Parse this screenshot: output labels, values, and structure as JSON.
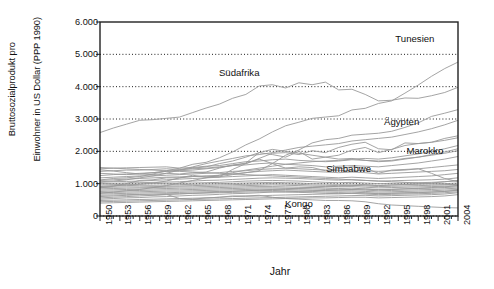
{
  "chart_data": {
    "type": "line",
    "title": "",
    "xlabel": "Jahr",
    "ylabel_line1": "Bruttosozialprodukt pro",
    "ylabel_line2": "Einwohner in US Dollar (PPP 1990)",
    "xlim": [
      1950,
      2004
    ],
    "ylim": [
      0,
      6000
    ],
    "grid": "horizontal-dotted",
    "legend": "inline-annotations",
    "yticks": [
      "0",
      "1.000",
      "2.000",
      "3.000",
      "4.000",
      "5.000",
      "6.000"
    ],
    "ytick_values": [
      0,
      1000,
      2000,
      3000,
      4000,
      5000,
      6000
    ],
    "xticks": [
      "1950",
      "1953",
      "1956",
      "1959",
      "1962",
      "1965",
      "1968",
      "1971",
      "1974",
      "1977",
      "1980",
      "1983",
      "1986",
      "1989",
      "1992",
      "1995",
      "1998",
      "2001",
      "2004"
    ],
    "xtick_values": [
      1950,
      1953,
      1956,
      1959,
      1962,
      1965,
      1968,
      1971,
      1974,
      1977,
      1980,
      1983,
      1986,
      1989,
      1992,
      1995,
      1998,
      2001,
      2004
    ],
    "line_color": "#9a9a9a",
    "annotations": [
      {
        "label": "Tunesien",
        "x": 1997.5,
        "y": 5500
      },
      {
        "label": "Südafrika",
        "x": 1971.0,
        "y": 4460
      },
      {
        "label": "Ägypten",
        "x": 1995.5,
        "y": 2930
      },
      {
        "label": "Marokko",
        "x": 1999.0,
        "y": 2030
      },
      {
        "label": "Simbabwe",
        "x": 1987.5,
        "y": 1480
      },
      {
        "label": "Kongo",
        "x": 1980.0,
        "y": 410
      }
    ],
    "x": [
      1950,
      1952,
      1954,
      1956,
      1958,
      1960,
      1962,
      1964,
      1966,
      1968,
      1970,
      1972,
      1974,
      1976,
      1978,
      1980,
      1982,
      1984,
      1986,
      1988,
      1990,
      1992,
      1994,
      1996,
      1998,
      2000,
      2002,
      2004
    ],
    "series": [
      {
        "name": "Tunesien",
        "values": [
          1115,
          1160,
          1180,
          1220,
          1300,
          1400,
          1480,
          1600,
          1660,
          1800,
          1980,
          2200,
          2380,
          2600,
          2790,
          2900,
          3020,
          3060,
          3100,
          3280,
          3330,
          3480,
          3560,
          3800,
          4050,
          4320,
          4560,
          4760
        ]
      },
      {
        "name": "Südafrika",
        "values": [
          2580,
          2720,
          2840,
          2960,
          2980,
          3020,
          3060,
          3200,
          3340,
          3460,
          3640,
          3760,
          4020,
          4060,
          3960,
          4120,
          4060,
          4140,
          3900,
          3920,
          3760,
          3560,
          3580,
          3650,
          3640,
          3720,
          3820,
          3980
        ]
      },
      {
        "name": "Ägypten",
        "values": [
          910,
          930,
          960,
          980,
          1020,
          1080,
          1180,
          1220,
          1230,
          1210,
          1280,
          1340,
          1400,
          1620,
          1880,
          2040,
          2260,
          2360,
          2400,
          2500,
          2530,
          2560,
          2620,
          2740,
          2880,
          3080,
          3180,
          3290
        ]
      },
      {
        "name": "Marokko",
        "values": [
          1430,
          1390,
          1340,
          1300,
          1280,
          1320,
          1300,
          1340,
          1360,
          1480,
          1580,
          1620,
          1780,
          1940,
          1960,
          1900,
          2020,
          1960,
          2120,
          2220,
          2280,
          2080,
          2050,
          2260,
          2240,
          2280,
          2400,
          2480
        ]
      },
      {
        "name": "Simbabwe",
        "values": [
          870,
          920,
          1000,
          1100,
          1120,
          1180,
          1180,
          1260,
          1200,
          1210,
          1440,
          1620,
          1760,
          1620,
          1480,
          1520,
          1500,
          1400,
          1460,
          1520,
          1480,
          1320,
          1420,
          1440,
          1460,
          1320,
          1160,
          1060
        ]
      },
      {
        "name": "Kongo",
        "values": [
          600,
          620,
          640,
          660,
          650,
          670,
          540,
          520,
          560,
          580,
          620,
          620,
          640,
          580,
          540,
          520,
          500,
          480,
          480,
          470,
          440,
          380,
          340,
          320,
          300,
          280,
          260,
          250
        ]
      },
      {
        "name": "other-01",
        "values": [
          1460,
          1480,
          1490,
          1500,
          1510,
          1520,
          1480,
          1500,
          1540,
          1560,
          1620,
          1680,
          1700,
          1740,
          1760,
          1720,
          1700,
          1680,
          1700,
          1740,
          1720,
          1700,
          1720,
          1780,
          1820,
          1880,
          1940,
          2020
        ]
      },
      {
        "name": "other-02",
        "values": [
          1380,
          1400,
          1420,
          1420,
          1440,
          1460,
          1440,
          1460,
          1480,
          1520,
          1560,
          1580,
          1620,
          1640,
          1600,
          1580,
          1560,
          1520,
          1540,
          1560,
          1540,
          1520,
          1560,
          1600,
          1640,
          1700,
          1760,
          1840
        ]
      },
      {
        "name": "other-03",
        "values": [
          1250,
          1280,
          1300,
          1320,
          1340,
          1380,
          1400,
          1420,
          1460,
          1500,
          1560,
          1640,
          1960,
          1900,
          1820,
          2000,
          1760,
          1820,
          1880,
          2040,
          2120,
          1960,
          2060,
          2180,
          2240,
          2280,
          2340,
          2420
        ]
      },
      {
        "name": "other-04",
        "values": [
          1180,
          1200,
          1220,
          1240,
          1240,
          1260,
          1280,
          1300,
          1320,
          1340,
          1380,
          1400,
          1440,
          1460,
          1480,
          1460,
          1440,
          1420,
          1400,
          1420,
          1400,
          1380,
          1400,
          1420,
          1460,
          1500,
          1540,
          1580
        ]
      },
      {
        "name": "other-05",
        "values": [
          1100,
          1120,
          1140,
          1160,
          1180,
          1200,
          1210,
          1220,
          1240,
          1260,
          1300,
          1340,
          1380,
          1400,
          1420,
          1400,
          1380,
          1360,
          1340,
          1360,
          1340,
          1300,
          1320,
          1340,
          1360,
          1380,
          1400,
          1440
        ]
      },
      {
        "name": "other-06",
        "values": [
          1040,
          1060,
          1070,
          1080,
          1100,
          1120,
          1140,
          1160,
          1180,
          1200,
          1220,
          1240,
          1260,
          1280,
          1260,
          1240,
          1220,
          1200,
          1180,
          1200,
          1180,
          1160,
          1180,
          1200,
          1220,
          1240,
          1280,
          1320
        ]
      },
      {
        "name": "other-07",
        "values": [
          1000,
          1010,
          1020,
          1030,
          1040,
          1050,
          1060,
          1080,
          1100,
          1110,
          1130,
          1150,
          1170,
          1180,
          1170,
          1160,
          1140,
          1120,
          1110,
          1120,
          1100,
          1080,
          1090,
          1100,
          1110,
          1120,
          1140,
          1180
        ]
      },
      {
        "name": "other-08",
        "values": [
          960,
          970,
          980,
          990,
          1000,
          1010,
          1010,
          1020,
          1030,
          1040,
          1060,
          1080,
          1090,
          1100,
          1090,
          1080,
          1060,
          1040,
          1030,
          1040,
          1020,
          1000,
          1010,
          1020,
          1030,
          1040,
          1060,
          1090
        ]
      },
      {
        "name": "other-09",
        "values": [
          920,
          930,
          940,
          950,
          950,
          960,
          970,
          980,
          990,
          1000,
          1010,
          1020,
          1030,
          1040,
          1030,
          1020,
          1000,
          990,
          980,
          990,
          970,
          950,
          960,
          970,
          980,
          990,
          1000,
          1020
        ]
      },
      {
        "name": "other-10",
        "values": [
          880,
          890,
          900,
          900,
          910,
          920,
          930,
          940,
          950,
          960,
          970,
          980,
          990,
          1000,
          990,
          980,
          960,
          950,
          940,
          950,
          930,
          910,
          920,
          930,
          940,
          950,
          960,
          980
        ]
      },
      {
        "name": "other-11",
        "values": [
          840,
          850,
          860,
          870,
          880,
          890,
          900,
          900,
          910,
          920,
          930,
          940,
          950,
          960,
          950,
          940,
          920,
          910,
          900,
          910,
          890,
          870,
          880,
          890,
          900,
          910,
          920,
          940
        ]
      },
      {
        "name": "other-12",
        "values": [
          800,
          810,
          820,
          830,
          840,
          850,
          860,
          860,
          870,
          880,
          890,
          900,
          910,
          910,
          900,
          890,
          880,
          860,
          850,
          860,
          840,
          820,
          830,
          840,
          850,
          860,
          880,
          900
        ]
      },
      {
        "name": "other-13",
        "values": [
          760,
          770,
          780,
          790,
          800,
          810,
          810,
          820,
          830,
          840,
          850,
          860,
          870,
          870,
          860,
          850,
          840,
          820,
          810,
          820,
          800,
          780,
          790,
          800,
          810,
          820,
          840,
          860
        ]
      },
      {
        "name": "other-14",
        "values": [
          720,
          730,
          740,
          750,
          760,
          770,
          770,
          780,
          790,
          800,
          810,
          820,
          830,
          830,
          820,
          810,
          800,
          780,
          770,
          780,
          760,
          740,
          750,
          760,
          770,
          780,
          800,
          820
        ]
      },
      {
        "name": "other-15",
        "values": [
          680,
          690,
          700,
          710,
          720,
          720,
          730,
          740,
          750,
          760,
          770,
          780,
          790,
          790,
          780,
          770,
          760,
          740,
          730,
          740,
          720,
          700,
          710,
          720,
          730,
          740,
          760,
          790
        ]
      },
      {
        "name": "other-16",
        "values": [
          640,
          650,
          660,
          670,
          680,
          690,
          690,
          700,
          710,
          720,
          730,
          740,
          750,
          750,
          740,
          730,
          720,
          700,
          690,
          700,
          680,
          660,
          670,
          680,
          690,
          700,
          720,
          750
        ]
      },
      {
        "name": "other-17",
        "values": [
          560,
          580,
          600,
          620,
          640,
          660,
          680,
          700,
          720,
          740,
          760,
          780,
          800,
          820,
          840,
          860,
          880,
          900,
          920,
          940,
          960,
          940,
          960,
          980,
          1000,
          1020,
          1060,
          1100
        ]
      },
      {
        "name": "other-18",
        "values": [
          520,
          540,
          560,
          570,
          590,
          600,
          620,
          640,
          650,
          670,
          690,
          700,
          720,
          740,
          750,
          760,
          780,
          790,
          800,
          820,
          830,
          810,
          820,
          840,
          860,
          880,
          900,
          940
        ]
      },
      {
        "name": "other-19",
        "values": [
          480,
          490,
          500,
          510,
          520,
          530,
          540,
          550,
          560,
          580,
          600,
          610,
          620,
          640,
          650,
          660,
          670,
          680,
          690,
          700,
          710,
          690,
          700,
          710,
          720,
          740,
          760,
          800
        ]
      },
      {
        "name": "other-20",
        "values": [
          440,
          450,
          460,
          470,
          480,
          490,
          500,
          510,
          520,
          530,
          540,
          550,
          560,
          570,
          580,
          590,
          600,
          610,
          620,
          630,
          640,
          620,
          630,
          640,
          650,
          660,
          680,
          720
        ]
      },
      {
        "name": "other-21",
        "values": [
          400,
          410,
          420,
          430,
          440,
          450,
          460,
          470,
          480,
          490,
          500,
          510,
          520,
          530,
          540,
          550,
          560,
          560,
          570,
          580,
          580,
          560,
          570,
          580,
          590,
          600,
          620,
          660
        ]
      },
      {
        "name": "other-22",
        "values": [
          1320,
          1300,
          1280,
          1300,
          1340,
          1380,
          1420,
          1480,
          1520,
          1620,
          1700,
          1820,
          1960,
          2060,
          2000,
          1940,
          1880,
          1820,
          1760,
          1780,
          1720,
          1680,
          1700,
          1760,
          1820,
          1900,
          1980,
          2080
        ]
      },
      {
        "name": "other-23",
        "values": [
          1060,
          1080,
          1120,
          1180,
          1240,
          1320,
          1420,
          1520,
          1620,
          1700,
          1780,
          1860,
          1900,
          1960,
          2040,
          2120,
          2160,
          2200,
          2240,
          2320,
          2360,
          2400,
          2440,
          2520,
          2600,
          2700,
          2820,
          2960
        ]
      },
      {
        "name": "other-24",
        "values": [
          700,
          740,
          780,
          820,
          880,
          940,
          1020,
          1100,
          1180,
          1260,
          1340,
          1420,
          1480,
          1540,
          1600,
          1640,
          1680,
          1700,
          1720,
          1760,
          1780,
          1760,
          1800,
          1860,
          1920,
          2000,
          2080,
          2180
        ]
      },
      {
        "name": "other-25",
        "values": [
          1500,
          1480,
          1460,
          1440,
          1420,
          1400,
          1380,
          1360,
          1340,
          1320,
          1300,
          1280,
          1260,
          1240,
          1220,
          1200,
          1180,
          1160,
          1140,
          1120,
          1100,
          1080,
          1060,
          1040,
          1020,
          1000,
          980,
          960
        ]
      }
    ]
  }
}
